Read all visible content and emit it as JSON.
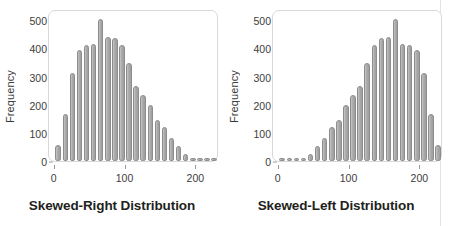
{
  "figure": {
    "background_color": "#ffffff",
    "bar_fill_color": "#a8a8a8",
    "bar_edge_color": "#8d8d8d",
    "frame_color": "#d8d8d8",
    "text_color": "#231f20"
  },
  "chart_data": [
    {
      "type": "bar",
      "title": "Skewed-Right Distribution",
      "xlabel": "",
      "ylabel": "Frequency",
      "ylim": [
        0,
        540
      ],
      "xlim": [
        -8,
        232
      ],
      "grid": false,
      "legend": "none",
      "yticks": [
        0,
        100,
        200,
        300,
        400,
        500
      ],
      "xticks": [
        0,
        100,
        200
      ],
      "bin_width": 10,
      "x": [
        5,
        15,
        25,
        35,
        45,
        55,
        65,
        75,
        85,
        95,
        105,
        115,
        125,
        135,
        145,
        155,
        165,
        175,
        185,
        195,
        205,
        215,
        225
      ],
      "values": [
        58,
        168,
        313,
        393,
        412,
        415,
        505,
        440,
        438,
        412,
        348,
        268,
        235,
        200,
        145,
        120,
        82,
        52,
        26,
        12,
        10,
        9,
        8
      ]
    },
    {
      "type": "bar",
      "title": "Skewed-Left Distribution",
      "xlabel": "",
      "ylabel": "Frequency",
      "ylim": [
        0,
        540
      ],
      "xlim": [
        -8,
        232
      ],
      "grid": false,
      "legend": "none",
      "yticks": [
        0,
        100,
        200,
        300,
        400,
        500
      ],
      "xticks": [
        0,
        100,
        200
      ],
      "bin_width": 10,
      "x": [
        5,
        15,
        25,
        35,
        45,
        55,
        65,
        75,
        85,
        95,
        105,
        115,
        125,
        135,
        145,
        155,
        165,
        175,
        185,
        195,
        205,
        215,
        225
      ],
      "values": [
        8,
        9,
        10,
        12,
        26,
        52,
        82,
        120,
        145,
        200,
        235,
        268,
        348,
        412,
        438,
        440,
        505,
        415,
        412,
        393,
        313,
        168,
        58
      ]
    }
  ],
  "top_cut_text": ""
}
